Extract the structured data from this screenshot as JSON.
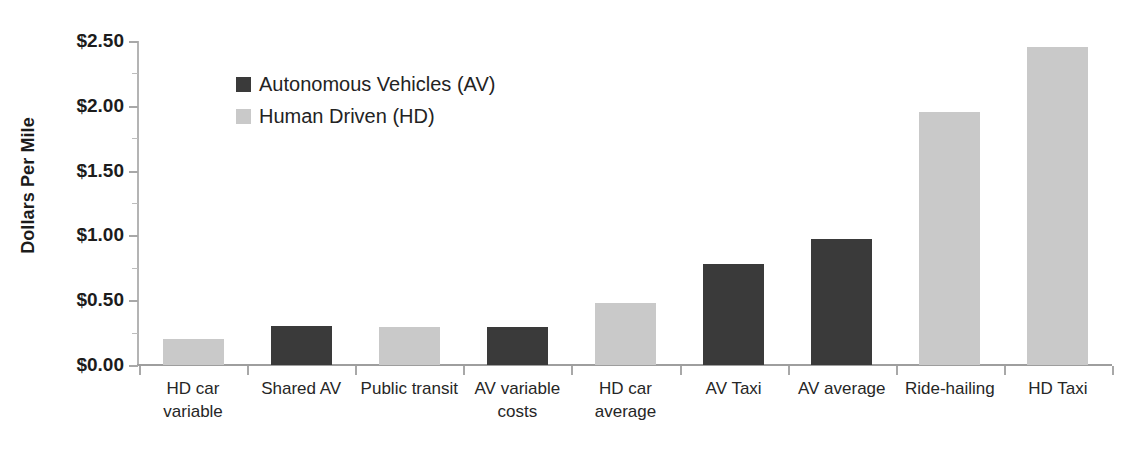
{
  "chart_data": {
    "type": "bar",
    "title": "",
    "subtitle": "",
    "xlabel": "",
    "ylabel": "Dollars Per Mile",
    "ylim": [
      0,
      2.5
    ],
    "ytick_values": [
      0,
      0.5,
      1.0,
      1.5,
      2.0,
      2.5
    ],
    "ytick_labels": [
      "$0.00",
      "$0.50",
      "$1.00",
      "$1.50",
      "$2.00",
      "$2.50"
    ],
    "yminor_step": 0.25,
    "grid": false,
    "legend_position": "upper-left-inside",
    "categories": [
      "HD car variable",
      "Shared AV",
      "Public transit",
      "AV variable costs",
      "HD car average",
      "AV Taxi",
      "AV average",
      "Ride-hailing",
      "HD Taxi"
    ],
    "values": [
      0.2,
      0.3,
      0.29,
      0.29,
      0.48,
      0.78,
      0.97,
      1.95,
      2.45
    ],
    "point_groups": [
      "HD",
      "AV",
      "HD",
      "AV",
      "HD",
      "AV",
      "AV",
      "HD",
      "HD"
    ],
    "series": [
      {
        "name": "Autonomous Vehicles (AV)",
        "color": "#3a3a3a",
        "points": [
          {
            "category": "Shared AV",
            "value": 0.3
          },
          {
            "category": "AV variable costs",
            "value": 0.29
          },
          {
            "category": "AV Taxi",
            "value": 0.78
          },
          {
            "category": "AV average",
            "value": 0.97
          }
        ]
      },
      {
        "name": "Human Driven (HD)",
        "color": "#c9c9c9",
        "points": [
          {
            "category": "HD car variable",
            "value": 0.2
          },
          {
            "category": "Public transit",
            "value": 0.29
          },
          {
            "category": "HD car average",
            "value": 0.48
          },
          {
            "category": "Ride-hailing",
            "value": 1.95
          },
          {
            "category": "HD Taxi",
            "value": 2.45
          }
        ]
      }
    ]
  },
  "legend": {
    "items": [
      {
        "label": "Autonomous Vehicles (AV)",
        "color": "#3a3a3a",
        "swatch_name": "legend-swatch-av"
      },
      {
        "label": "Human Driven (HD)",
        "color": "#c9c9c9",
        "swatch_name": "legend-swatch-hd"
      }
    ]
  },
  "axis": {
    "y_title": "Dollars Per Mile"
  }
}
